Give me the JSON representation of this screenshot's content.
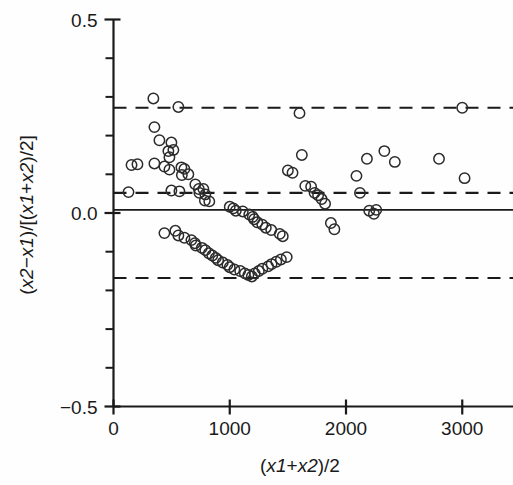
{
  "figure": {
    "type": "bland-altman-scatter",
    "background": "#ffffff",
    "ink": "#1a1a1a"
  },
  "chart_data": {
    "type": "scatter",
    "title": "",
    "xlabel": "(x1+x2)/2",
    "ylabel": "(x2−x1)/[(x1+x2)/2]",
    "xlabel_parts": {
      "open": "(",
      "v1": "x1",
      "plus": "+",
      "v2": "x2",
      "close": ")/2"
    },
    "ylabel_parts": {
      "open": "(",
      "v1": "x2",
      "minus": "−",
      "v2": "x1",
      "mid": ")/[(",
      "v3": "x1",
      "plus": "+",
      "v4": "x2",
      "close": ")/2]"
    },
    "xlim": [
      0,
      3440
    ],
    "ylim": [
      -0.5,
      0.5
    ],
    "xticks": [
      0,
      1000,
      2000,
      3000
    ],
    "xtick_labels": [
      "0",
      "1000",
      "2000",
      "3000"
    ],
    "yticks": [
      -0.5,
      0.0,
      0.5
    ],
    "ytick_labels": [
      "−0.5",
      "0.0",
      "0.5"
    ],
    "y_minor_ticks": [
      -0.4,
      -0.3,
      -0.2,
      -0.1,
      0.1,
      0.2,
      0.3,
      0.4
    ],
    "grid": false,
    "legend": "none",
    "marker": {
      "shape": "open-circle",
      "radius_px": 5.2,
      "stroke": "#2b2b2b",
      "stroke_width": 1.5,
      "fill": "none"
    },
    "reference_lines": [
      {
        "name": "upper-limit-of-agreement",
        "value": 0.272,
        "style": "dashed"
      },
      {
        "name": "upper-inner-line",
        "value": 0.052,
        "style": "dashed"
      },
      {
        "name": "mean-bias-line",
        "value": 0.008,
        "style": "solid"
      },
      {
        "name": "lower-limit-of-agreement",
        "value": -0.168,
        "style": "dashed"
      }
    ],
    "x": [
      343,
      558,
      352,
      395,
      498,
      515,
      206,
      472,
      481,
      155,
      129,
      352,
      438,
      481,
      584,
      588,
      610,
      644,
      704,
      734,
      773,
      790,
      498,
      567,
      739,
      786,
      824,
      1000,
      1031,
      1052,
      1112,
      1168,
      1198,
      1210,
      1237,
      1280,
      1310,
      1357,
      1430,
      1456,
      438,
      532,
      558,
      610,
      670,
      700,
      708,
      760,
      790,
      820,
      850,
      880,
      900,
      940,
      980,
      1000,
      1040,
      1090,
      1130,
      1160,
      1190,
      1215,
      1250,
      1280,
      1330,
      1360,
      1400,
      1440,
      1490,
      1600,
      1620,
      1650,
      1700,
      1730,
      1760,
      1790,
      1820,
      1870,
      1900,
      2180,
      2200,
      2240,
      2260,
      2330,
      2420,
      2800,
      3000,
      3020,
      2090,
      2120,
      1500,
      1540
    ],
    "y": [
      0.296,
      0.274,
      0.222,
      0.188,
      0.182,
      0.163,
      0.126,
      0.16,
      0.144,
      0.124,
      0.054,
      0.128,
      0.12,
      0.112,
      0.118,
      0.098,
      0.114,
      0.1,
      0.074,
      0.062,
      0.062,
      0.048,
      0.058,
      0.056,
      0.052,
      0.032,
      0.03,
      0.016,
      0.012,
      0.006,
      0.004,
      -0.004,
      -0.01,
      -0.016,
      -0.024,
      -0.03,
      -0.038,
      -0.044,
      -0.054,
      -0.06,
      -0.052,
      -0.046,
      -0.058,
      -0.064,
      -0.07,
      -0.078,
      -0.084,
      -0.09,
      -0.096,
      -0.104,
      -0.11,
      -0.116,
      -0.122,
      -0.128,
      -0.134,
      -0.14,
      -0.146,
      -0.15,
      -0.156,
      -0.16,
      -0.164,
      -0.156,
      -0.15,
      -0.144,
      -0.138,
      -0.132,
      -0.126,
      -0.12,
      -0.114,
      0.258,
      0.15,
      0.07,
      0.068,
      0.052,
      0.046,
      0.036,
      0.024,
      -0.026,
      -0.042,
      0.14,
      0.006,
      -0.002,
      0.008,
      0.16,
      0.132,
      0.14,
      0.272,
      0.09,
      0.096,
      0.052,
      0.11,
      0.104
    ],
    "points_count": 92
  }
}
